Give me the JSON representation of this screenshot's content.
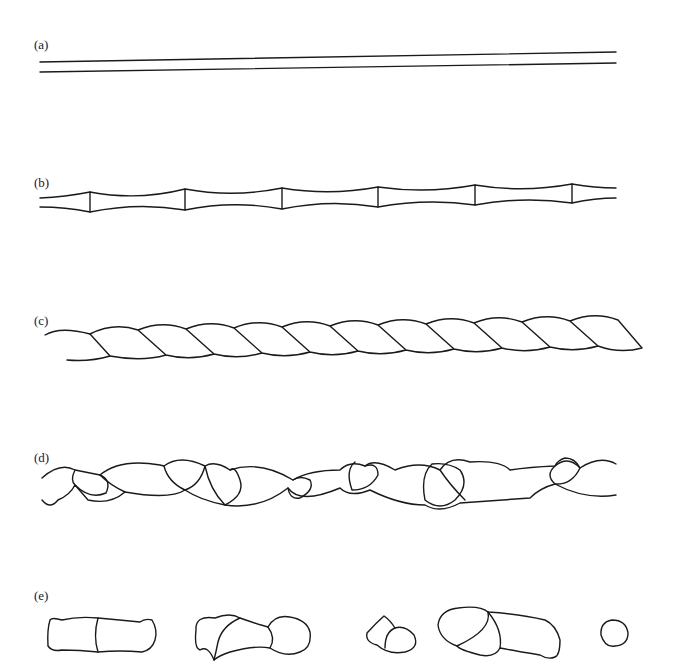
{
  "figure": {
    "panels": [
      {
        "id": "a",
        "label": "(a)",
        "description": "straight parallel lines (uniform filament)"
      },
      {
        "id": "b",
        "label": "(b)",
        "description": "filament with periodic necking constrictions"
      },
      {
        "id": "c",
        "label": "(c)",
        "description": "twisted rope-like helical filament"
      },
      {
        "id": "d",
        "label": "(d)",
        "description": "irregular chain of bulges and loops"
      },
      {
        "id": "e",
        "label": "(e)",
        "description": "broken-up separate fragments"
      }
    ],
    "colors": {
      "stroke": "#1a1a1a",
      "background": "#ffffff"
    }
  }
}
